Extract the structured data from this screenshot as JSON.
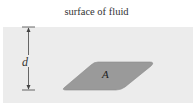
{
  "diagram": {
    "surface_label": "surface of fluid",
    "depth_label": "d",
    "area_label": "A",
    "colors": {
      "fluid": "#ececec",
      "plate": "#9a9a9a",
      "plate_edge": "#888888",
      "line": "#444444"
    }
  }
}
